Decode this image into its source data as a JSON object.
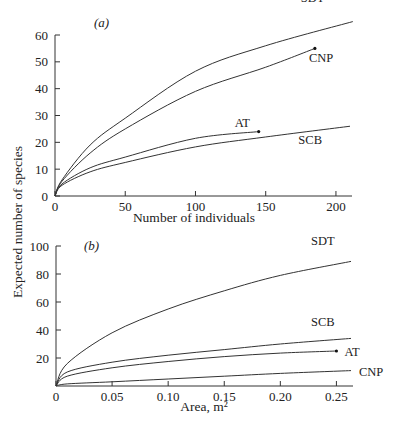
{
  "ylabel": "Expected number of species",
  "chart_data": [
    {
      "type": "line",
      "panel_label": "(a)",
      "title": "",
      "xlabel": "Number of individuals",
      "ylabel": "Expected number of species",
      "xlim": [
        0,
        210
      ],
      "ylim": [
        0,
        60
      ],
      "xticks": [
        0,
        50,
        100,
        150,
        200
      ],
      "yticks": [
        0,
        10,
        20,
        30,
        40,
        50,
        60
      ],
      "grid": false,
      "legend": "inline labels at curve ends",
      "series": [
        {
          "name": "SDT",
          "x": [
            0,
            5,
            25,
            50,
            100,
            150,
            212
          ],
          "values": [
            0,
            6,
            19,
            29,
            46.5,
            56,
            65
          ],
          "end_marker": false
        },
        {
          "name": "CNP",
          "x": [
            0,
            5,
            25,
            50,
            100,
            150,
            185
          ],
          "values": [
            0,
            5.5,
            16,
            25,
            39,
            48,
            55
          ],
          "end_marker": true
        },
        {
          "name": "AT",
          "x": [
            0,
            5,
            25,
            50,
            100,
            145
          ],
          "values": [
            0,
            4.5,
            10.5,
            14.5,
            21.5,
            24
          ],
          "end_marker": true
        },
        {
          "name": "SCB",
          "x": [
            0,
            5,
            25,
            50,
            100,
            150,
            210
          ],
          "values": [
            0,
            4,
            9,
            12.5,
            18.3,
            22,
            26
          ],
          "end_marker": false
        }
      ]
    },
    {
      "type": "line",
      "panel_label": "(b)",
      "title": "",
      "xlabel": "Area, m²",
      "ylabel": "Expected number of species",
      "xlim": [
        0,
        0.263
      ],
      "ylim": [
        0,
        100
      ],
      "xticks": [
        "0",
        "0.05",
        "0.10",
        "0.15",
        "0.20",
        "0.25"
      ],
      "yticks": [
        20,
        40,
        60,
        80,
        100
      ],
      "grid": false,
      "legend": "inline labels at curve ends",
      "series": [
        {
          "name": "SDT",
          "x": [
            0,
            0.01,
            0.05,
            0.1,
            0.15,
            0.2,
            0.263
          ],
          "values": [
            0,
            16,
            38,
            55,
            68,
            79,
            89
          ],
          "end_marker": false
        },
        {
          "name": "SCB",
          "x": [
            0,
            0.01,
            0.05,
            0.1,
            0.15,
            0.2,
            0.263
          ],
          "values": [
            0,
            10,
            17,
            22,
            26,
            30,
            34
          ],
          "end_marker": false
        },
        {
          "name": "AT",
          "x": [
            0,
            0.01,
            0.05,
            0.1,
            0.15,
            0.2,
            0.25
          ],
          "values": [
            0,
            7,
            13,
            17.5,
            21,
            23.5,
            25
          ],
          "end_marker": true
        },
        {
          "name": "CNP",
          "x": [
            0,
            0.01,
            0.05,
            0.1,
            0.15,
            0.2,
            0.263
          ],
          "values": [
            0,
            1.5,
            3,
            5,
            7,
            9,
            11
          ],
          "end_marker": false
        }
      ]
    }
  ]
}
